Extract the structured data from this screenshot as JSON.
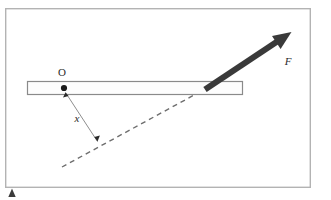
{
  "figure": {
    "type": "physics-free-body-diagram",
    "frame": {
      "name": "figure-border",
      "x": 5,
      "y": 8,
      "width": 306,
      "height": 180,
      "stroke_color": "#b3b3b3",
      "fill_color": "#ffffff",
      "stroke_width": 1.4
    },
    "bar": {
      "name": "rigid-bar",
      "x": 27,
      "y": 81,
      "width": 216,
      "height": 14,
      "stroke_color": "#8a8a8a",
      "fill_color": "#fdfdfd",
      "stroke_width": 1.2
    },
    "pivot": {
      "name": "pivot-point-O",
      "cx": 64,
      "cy": 88,
      "r": 3.1,
      "color": "#1a1a1a",
      "label": "O",
      "label_x": 62,
      "label_y": 76,
      "label_style": "upright"
    },
    "force": {
      "name": "force-vector-F",
      "label": "F",
      "label_x": 288,
      "label_y": 65,
      "label_style": "italic",
      "color": "#3a3a3a",
      "tail_x": 205,
      "tail_y": 89,
      "tip_x": 290,
      "tip_y": 33,
      "shaft_width": 6,
      "head_length": 19,
      "head_half_width": 8.5
    },
    "line_of_action": {
      "name": "force-line-of-action",
      "style": "dashed",
      "color": "#6e6e6e",
      "stroke_width": 1.4,
      "dash_pattern": "5 4",
      "x1": 62,
      "y1": 167,
      "x2": 205,
      "y2": 89
    },
    "lever_arm": {
      "name": "lever-arm-x",
      "label": "x",
      "label_x": 77,
      "label_y": 122,
      "label_style": "italic",
      "color": "#7a7a7a",
      "stroke_width": 1.0,
      "from_x": 65,
      "from_y": 92,
      "to_x": 98,
      "to_y": 142,
      "arrowheads": "both",
      "head_size": 4
    },
    "corner_marker": {
      "name": "bottom-left-triangle-marker",
      "cx": 12,
      "cy": 193,
      "width": 8,
      "height": 9,
      "color": "#3c3c3c"
    }
  }
}
